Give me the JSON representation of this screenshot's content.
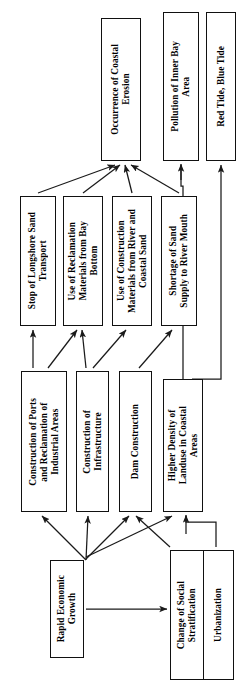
{
  "diagram": {
    "orientation": "rotated-90-ccw",
    "node_fill": "#ffffff",
    "node_stroke": "#111111",
    "edge_color": "#1a1a1a",
    "nodes": [
      {
        "id": "coastal_erosion",
        "label": "Occurrence of Coastal\nErosion",
        "x": 101,
        "y": 18,
        "w": 40,
        "h": 143
      },
      {
        "id": "pollution_bay",
        "label": "Pollution of Inner Bay\nArea",
        "x": 163,
        "y": 12,
        "w": 36,
        "h": 149
      },
      {
        "id": "red_blue_tide",
        "label": "Red Tide, Blue Tide",
        "x": 206,
        "y": 12,
        "w": 30,
        "h": 149
      },
      {
        "id": "stop_longshore",
        "label": "Stop of Longshore Sand\nTransport",
        "x": 20,
        "y": 196,
        "w": 36,
        "h": 130
      },
      {
        "id": "reclamation_mat",
        "label": "Use of Reclamation\nMaterials from Bay\nBottom",
        "x": 63,
        "y": 196,
        "w": 40,
        "h": 130
      },
      {
        "id": "construction_mat",
        "label": "Use of Construction\nMaterials from River and\nCoastal Sand",
        "x": 112,
        "y": 196,
        "w": 40,
        "h": 130
      },
      {
        "id": "sand_shortage",
        "label": "Shortage of Sand\nSupply to River Mouth",
        "x": 161,
        "y": 196,
        "w": 36,
        "h": 130
      },
      {
        "id": "ports_reclaim",
        "label": "Construction of Ports\nand Reclamation of\nIndustrial Areas",
        "x": 21,
        "y": 371,
        "w": 46,
        "h": 141
      },
      {
        "id": "infrastructure",
        "label": "Construction of\nInfrastructure",
        "x": 76,
        "y": 371,
        "w": 33,
        "h": 141
      },
      {
        "id": "dam_construction",
        "label": "Dam Construction",
        "x": 119,
        "y": 371,
        "w": 33,
        "h": 141
      },
      {
        "id": "landuse_density",
        "label": "Higher Density of\nLanduse in Coastal\nAreas",
        "x": 163,
        "y": 379,
        "w": 40,
        "h": 133
      },
      {
        "id": "rapid_growth",
        "label": "Rapid Economic\nGrowth",
        "x": 50,
        "y": 560,
        "w": 34,
        "h": 98
      },
      {
        "id": "social_strat",
        "label": "Change of Social\nStratification",
        "x": 170,
        "y": 550,
        "w": 33,
        "h": 130
      },
      {
        "id": "urbanization",
        "label": "Urbanization",
        "x": 203,
        "y": 550,
        "w": 31,
        "h": 130
      }
    ],
    "edges": [
      {
        "from": "stop_longshore",
        "to": "coastal_erosion"
      },
      {
        "from": "reclamation_mat",
        "to": "coastal_erosion"
      },
      {
        "from": "construction_mat",
        "to": "coastal_erosion"
      },
      {
        "from": "sand_shortage",
        "to": "coastal_erosion"
      },
      {
        "from": "landuse_density",
        "to": "pollution_bay"
      },
      {
        "from": "landuse_density",
        "to": "red_blue_tide"
      },
      {
        "from": "ports_reclaim",
        "to": "stop_longshore"
      },
      {
        "from": "ports_reclaim",
        "to": "reclamation_mat"
      },
      {
        "from": "infrastructure",
        "to": "reclamation_mat"
      },
      {
        "from": "infrastructure",
        "to": "construction_mat"
      },
      {
        "from": "dam_construction",
        "to": "sand_shortage"
      },
      {
        "from": "rapid_growth",
        "to": "ports_reclaim"
      },
      {
        "from": "rapid_growth",
        "to": "infrastructure"
      },
      {
        "from": "rapid_growth",
        "to": "dam_construction"
      },
      {
        "from": "rapid_growth",
        "to": "landuse_density"
      },
      {
        "from": "rapid_growth",
        "to": "social_strat"
      },
      {
        "from": "social_strat",
        "to": "dam_construction"
      },
      {
        "from": "urbanization",
        "to": "landuse_density"
      }
    ]
  }
}
